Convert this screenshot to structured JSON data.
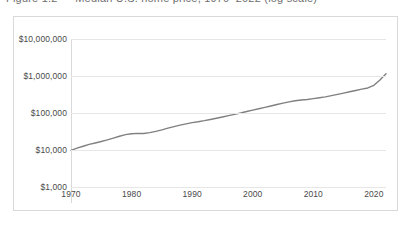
{
  "clipped_caption": "Figure 1.2 — Median U.S. home price, 1970–2022 (log scale)",
  "chart": {
    "frame_border_color": "#d9d9d9",
    "gridline_color": "#e6e6e6",
    "tick_text_color": "#4a4a4a"
  },
  "chart_data": {
    "type": "line",
    "title": "",
    "subtitle": "",
    "xlabel": "",
    "ylabel": "",
    "grid": true,
    "legend": "none",
    "yscale": "log",
    "xlim": [
      1970,
      2022
    ],
    "ylim": [
      1000,
      10000000
    ],
    "ytick_labels": [
      "$10,000,000",
      "$1,000,000",
      "$100,000",
      "$10,000",
      "$1,000"
    ],
    "ytick_values": [
      10000000,
      1000000,
      100000,
      10000,
      1000
    ],
    "xtick_labels": [
      "1970",
      "1980",
      "1990",
      "2000",
      "2010",
      "2020"
    ],
    "xtick_values": [
      1970,
      1980,
      1990,
      2000,
      2010,
      2020
    ],
    "series": [
      {
        "name": "value",
        "color": "#808080",
        "x": [
          1970,
          1971,
          1972,
          1973,
          1974,
          1975,
          1976,
          1977,
          1978,
          1979,
          1980,
          1981,
          1982,
          1983,
          1984,
          1985,
          1986,
          1987,
          1988,
          1989,
          1990,
          1991,
          1992,
          1993,
          1994,
          1995,
          1996,
          1997,
          1998,
          1999,
          2000,
          2001,
          2002,
          2003,
          2004,
          2005,
          2006,
          2007,
          2008,
          2009,
          2010,
          2011,
          2012,
          2013,
          2014,
          2015,
          2016,
          2017,
          2018,
          2019,
          2020,
          2021,
          2022
        ],
        "values": [
          9800,
          11200,
          12600,
          14200,
          15500,
          17000,
          18800,
          21000,
          23500,
          26000,
          27500,
          28200,
          28000,
          29500,
          32000,
          35000,
          39000,
          43000,
          47000,
          51000,
          55000,
          58000,
          62000,
          67000,
          72000,
          78000,
          85000,
          92000,
          100000,
          110000,
          120000,
          130000,
          142000,
          155000,
          170000,
          185000,
          200000,
          215000,
          225000,
          232000,
          245000,
          258000,
          272000,
          295000,
          320000,
          345000,
          375000,
          405000,
          440000,
          475000,
          560000,
          780000,
          1150000
        ]
      }
    ]
  }
}
